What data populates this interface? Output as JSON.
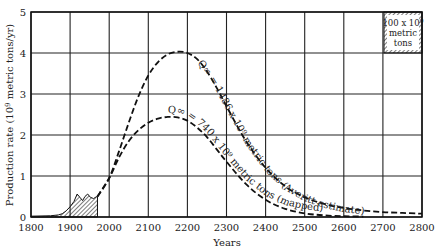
{
  "chart_data": {
    "type": "line",
    "title": "",
    "xlabel": "Years",
    "ylabel": "Production rate (10^9 metric tons/yr)",
    "ylabel_base": "Production rate (10",
    "ylabel_exp": "9",
    "ylabel_rest": " metric tons/yr)",
    "xlim": [
      1800,
      2800
    ],
    "ylim": [
      0,
      5
    ],
    "grid": true,
    "x_ticks": [
      1800,
      1900,
      2000,
      2100,
      2200,
      2300,
      2400,
      2500,
      2600,
      2700,
      2800
    ],
    "y_ticks": [
      0,
      1,
      2,
      3,
      4,
      5
    ],
    "series": [
      {
        "name": "Q∞ = 1486 × 10^9 metric tons (Averitt estimate)",
        "label": "Q∞ = 1486 x 10⁹ metric tons (Averitt estimate)",
        "style": "dashed",
        "x": [
          1970,
          2000,
          2025,
          2050,
          2075,
          2100,
          2125,
          2150,
          2175,
          2200,
          2225,
          2250,
          2275,
          2300,
          2350,
          2400,
          2450,
          2500,
          2550,
          2600,
          2650,
          2700,
          2750,
          2800
        ],
        "values": [
          0.5,
          0.95,
          1.6,
          2.3,
          2.95,
          3.45,
          3.78,
          3.97,
          4.03,
          4.0,
          3.85,
          3.55,
          3.15,
          2.7,
          1.85,
          1.2,
          0.75,
          0.48,
          0.32,
          0.22,
          0.16,
          0.12,
          0.1,
          0.08
        ]
      },
      {
        "name": "Q∞ = 740 × 10^9 metric tons (mapped)",
        "label": "Q∞ = 740 x 10⁹ metric tons (mapped)",
        "style": "dashed",
        "x": [
          1970,
          2000,
          2025,
          2050,
          2075,
          2100,
          2125,
          2150,
          2175,
          2200,
          2225,
          2250,
          2275,
          2300,
          2350,
          2400,
          2450,
          2500,
          2550,
          2600,
          2650
        ],
        "values": [
          0.5,
          0.95,
          1.45,
          1.85,
          2.12,
          2.3,
          2.4,
          2.44,
          2.43,
          2.35,
          2.18,
          1.95,
          1.65,
          1.35,
          0.8,
          0.42,
          0.2,
          0.09,
          0.04,
          0.02,
          0.01
        ]
      },
      {
        "name": "Historical production",
        "style": "hatched-area",
        "x": [
          1800,
          1850,
          1870,
          1880,
          1890,
          1900,
          1910,
          1918,
          1925,
          1932,
          1938,
          1945,
          1952,
          1960,
          1968,
          1970
        ],
        "values": [
          0.02,
          0.03,
          0.05,
          0.08,
          0.15,
          0.25,
          0.38,
          0.56,
          0.48,
          0.4,
          0.5,
          0.56,
          0.48,
          0.45,
          0.5,
          0.5
        ]
      }
    ],
    "annotations": [
      {
        "text": "100 x 10⁹ metric tons",
        "type": "legend-scale-box",
        "position": "top-right"
      }
    ],
    "legend_box": {
      "line1": "100 x 10",
      "exp": "9",
      "line2": "metric",
      "line3": "tons"
    }
  }
}
